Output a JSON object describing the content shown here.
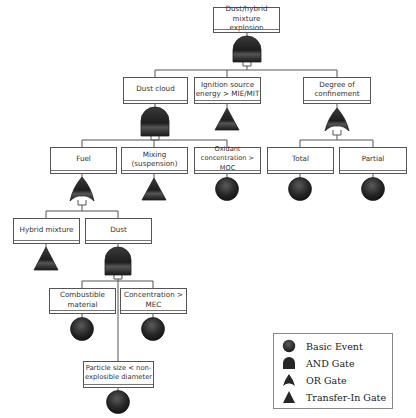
{
  "diagram": {
    "type": "fault-tree",
    "top_event": {
      "label_line1": "Dust/hybrid mixture",
      "label_line2": "explosion",
      "gate": "AND"
    },
    "level1": [
      {
        "id": "dust_cloud",
        "label_line1": "Dust cloud",
        "label_line2": "",
        "gate": "AND"
      },
      {
        "id": "ignition",
        "label_line1": "Ignition source",
        "label_line2": "energy > MIE/MIT",
        "gate": "Transfer-In"
      },
      {
        "id": "confinement",
        "label_line1": "Degree of",
        "label_line2": "confinement",
        "gate": "OR"
      }
    ],
    "level2": [
      {
        "id": "fuel",
        "parent": "dust_cloud",
        "label_line1": "Fuel",
        "label_line2": "",
        "gate": "OR"
      },
      {
        "id": "mixing",
        "parent": "dust_cloud",
        "label_line1": "Mixing",
        "label_line2": "(suspension)",
        "gate": "Transfer-In"
      },
      {
        "id": "oxidant",
        "parent": "dust_cloud",
        "label_line1": "Oxidant",
        "label_line2": "concentration > MOC",
        "gate": "Basic"
      },
      {
        "id": "total",
        "parent": "confinement",
        "label_line1": "Total",
        "label_line2": "",
        "gate": "Basic"
      },
      {
        "id": "partial",
        "parent": "confinement",
        "label_line1": "Partial",
        "label_line2": "",
        "gate": "Basic"
      }
    ],
    "level3": [
      {
        "id": "hybrid",
        "parent": "fuel",
        "label_line1": "Hybrid mixture",
        "label_line2": "",
        "gate": "Transfer-In"
      },
      {
        "id": "dust",
        "parent": "fuel",
        "label_line1": "Dust",
        "label_line2": "",
        "gate": "AND"
      }
    ],
    "level4": [
      {
        "id": "combustible",
        "parent": "dust",
        "label_line1": "Combustible",
        "label_line2": "material",
        "gate": "Basic"
      },
      {
        "id": "concentration",
        "parent": "dust",
        "label_line1": "Concentration >",
        "label_line2": "MEC",
        "gate": "Basic"
      },
      {
        "id": "particle",
        "parent": "dust",
        "label_line1": "Particle size < non-",
        "label_line2": "explosible diameter",
        "gate": "Basic"
      }
    ]
  },
  "legend": {
    "items": [
      {
        "symbol": "basic-event",
        "label": "Basic Event"
      },
      {
        "symbol": "and-gate",
        "label": "AND Gate"
      },
      {
        "symbol": "or-gate",
        "label": "OR Gate"
      },
      {
        "symbol": "transfer-in-gate",
        "label": "Transfer-In Gate"
      }
    ]
  },
  "colors": {
    "line": "#555555",
    "symbol_fill": "#2a2a2a",
    "symbol_highlight": "#6a6a6a",
    "box_border": "#555555",
    "text": "#333333"
  }
}
